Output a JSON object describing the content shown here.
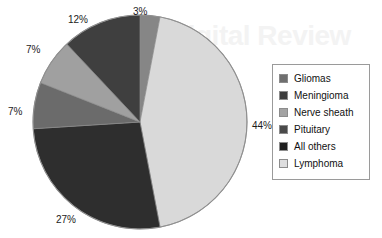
{
  "background": {
    "watermark_text": "Digital Review"
  },
  "chart_data": {
    "type": "pie",
    "title": "",
    "subtitle": "",
    "xlabel": "",
    "ylabel": "",
    "grid": false,
    "legend_position": "right",
    "start_angle_deg": 0,
    "direction": "clockwise",
    "unit": "%",
    "categories": [
      "Gliomas",
      "Lymphoma",
      "Meningioma",
      "Pituitary",
      "Nerve sheath",
      "All others"
    ],
    "values": [
      3,
      44,
      27,
      7,
      7,
      12
    ],
    "slices": [
      {
        "label": "Gliomas",
        "value": 3,
        "value_text": "3%",
        "color": "#868686",
        "start_deg": 0,
        "end_deg": 10.8
      },
      {
        "label": "Lymphoma",
        "value": 44,
        "value_text": "44%",
        "color": "#d9d9d9",
        "start_deg": 10.8,
        "end_deg": 169.2
      },
      {
        "label": "Meningioma",
        "value": 27,
        "value_text": "27%",
        "color": "#2e2e2e",
        "start_deg": 169.2,
        "end_deg": 266.4
      },
      {
        "label": "Pituitary",
        "value": 7,
        "value_text": "7%",
        "color": "#6b6b6b",
        "start_deg": 266.4,
        "end_deg": 291.6
      },
      {
        "label": "Nerve sheath",
        "value": 7,
        "value_text": "7%",
        "color": "#a0a0a0",
        "start_deg": 291.6,
        "end_deg": 316.8
      },
      {
        "label": "All others",
        "value": 12,
        "value_text": "12%",
        "color": "#3f3f3f",
        "start_deg": 316.8,
        "end_deg": 360
      }
    ],
    "legend": [
      {
        "label": "Gliomas",
        "color": "#6f6f6f"
      },
      {
        "label": "Meningioma",
        "color": "#3d3d3d"
      },
      {
        "label": "Nerve sheath",
        "color": "#a3a3a3"
      },
      {
        "label": "Pituitary",
        "color": "#4a4a4a"
      },
      {
        "label": "All others",
        "color": "#1f1f1f"
      },
      {
        "label": "Lymphoma",
        "color": "#dededf"
      }
    ]
  }
}
